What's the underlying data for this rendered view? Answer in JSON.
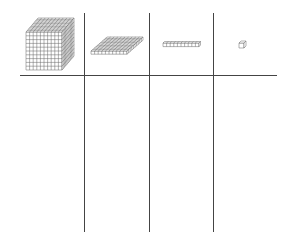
{
  "diagram": {
    "title": "",
    "columns": [
      {
        "block": "thousand-cube",
        "value": 1000,
        "grid": [
          10,
          10,
          10
        ]
      },
      {
        "block": "hundred-flat",
        "value": 100,
        "grid": [
          10,
          10,
          1
        ]
      },
      {
        "block": "ten-rod",
        "value": 10,
        "grid": [
          10,
          1,
          1
        ]
      },
      {
        "block": "one-unit",
        "value": 1,
        "grid": [
          1,
          1,
          1
        ]
      }
    ],
    "line_color": "#444444",
    "block_stroke": "#666666",
    "background": "#ffffff"
  }
}
